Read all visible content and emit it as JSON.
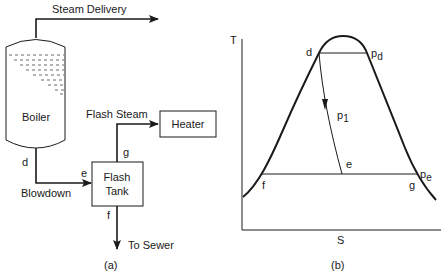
{
  "panel_a": {
    "caption": "(a)",
    "labels": {
      "steam_delivery": "Steam Delivery",
      "boiler": "Boiler",
      "flash_steam": "Flash Steam",
      "heater": "Heater",
      "flash_tank_line1": "Flash",
      "flash_tank_line2": "Tank",
      "blowdown": "Blowdown",
      "to_sewer": "To Sewer",
      "point_d": "d",
      "point_e": "e",
      "point_f": "f",
      "point_g": "g"
    }
  },
  "panel_b": {
    "caption": "(b)",
    "axis_y": "T",
    "axis_x": "S",
    "labels": {
      "point_d": "d",
      "pressure_d": "p",
      "pressure_d_sub": "d",
      "pressure_1": "p",
      "pressure_1_sub": "1",
      "point_e": "e",
      "pressure_e": "p",
      "pressure_e_sub": "e",
      "point_f": "f",
      "point_g": "g"
    }
  }
}
